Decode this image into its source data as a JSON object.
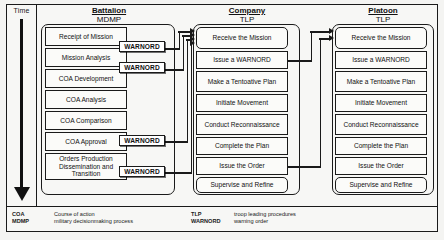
{
  "time_axis": {
    "label": "Time",
    "direction": "down"
  },
  "columns": [
    {
      "id": "battalion",
      "title": "Battalion",
      "subtitle": "MDMP",
      "steps": [
        "Receipt of Mission",
        "Mission Analysis",
        "COA Development",
        "COA Analysis",
        "COA Comparison",
        "COA Approval",
        "Orders Production Dissemination and Transition"
      ]
    },
    {
      "id": "company",
      "title": "Company",
      "subtitle": "TLP",
      "steps": [
        "Receive the Mission",
        "Issue a WARNORD",
        "Make a Tentoative Plan",
        "Initiate Movement",
        "Conduct Reconnaissance",
        "Complete the Plan",
        "Issue the Order",
        "Supervise and Refine"
      ]
    },
    {
      "id": "platoon",
      "title": "Platoon",
      "subtitle": "TLP",
      "steps": [
        "Receive the Mission",
        "Issue a WARNORD",
        "Make a Tentoative Plan",
        "Initiate Movement",
        "Conduct Reconnaissance",
        "Complete the Plan",
        "Issue the Order",
        "Supervise and Refine"
      ]
    }
  ],
  "warnord_tags": [
    {
      "id": "warnord-1",
      "label": "WARNORD",
      "from": "Receipt of Mission"
    },
    {
      "id": "warnord-2",
      "label": "WARNORD",
      "from": "Mission Analysis"
    },
    {
      "id": "warnord-3",
      "label": "WARNORD",
      "from": "COA Approval"
    },
    {
      "id": "warnord-4",
      "label": "WARNORD",
      "from": "Orders Production Dissemination and Transition"
    }
  ],
  "legend": {
    "left": [
      {
        "abbr": "COA",
        "definition": "Course of action"
      },
      {
        "abbr": "MDMP",
        "definition": "military decisionmaking process"
      }
    ],
    "right": [
      {
        "abbr": "TLP",
        "definition": "troop leading procedures"
      },
      {
        "abbr": "WARNORD",
        "definition": "warning order"
      }
    ]
  },
  "colors": {
    "line": "#1a1a1a",
    "box_fill": "#fbfbf9",
    "page_bg": "#f7f7f5"
  }
}
